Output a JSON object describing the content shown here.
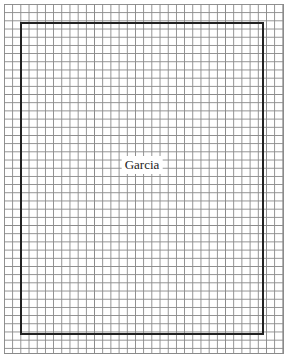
{
  "diagram": {
    "type": "grid-plan",
    "grid": {
      "line_color": "#8a8a8a",
      "cell_size_px": 8
    },
    "boundary": {
      "border_color": "#222222"
    },
    "label": "Garcia"
  }
}
